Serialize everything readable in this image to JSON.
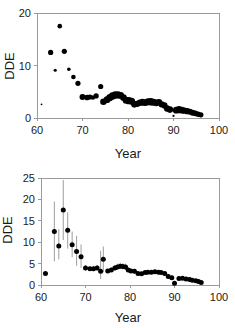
{
  "figure": {
    "background": "#ffffff",
    "point_color": "#000000",
    "axis_color": "#9a9a9a",
    "errorbar_color": "#9d9d9d"
  },
  "chart_data": [
    {
      "type": "scatter",
      "id": "top-panel",
      "title": "",
      "xlabel": "Year",
      "ylabel": "DDE",
      "xlim": [
        60,
        100
      ],
      "ylim": [
        0,
        20
      ],
      "xticks": [
        60,
        70,
        80,
        90,
        100
      ],
      "yticks": [
        0,
        10,
        20
      ],
      "xtick_labels": [
        "60",
        "70",
        "80",
        "90",
        "100"
      ],
      "ytick_labels": [
        "0",
        "10",
        "20"
      ],
      "grid": false,
      "legend": "none",
      "note": "Bubble scatter; marker area scales with sample size",
      "x": [
        61,
        63,
        64,
        65,
        66,
        67,
        68,
        69,
        70,
        71,
        71.6,
        72.3,
        73,
        74,
        74.6,
        75.4,
        76,
        76.6,
        77.2,
        77.8,
        78.4,
        79,
        79.6,
        80.2,
        80.8,
        81.4,
        82,
        82.6,
        83.2,
        83.8,
        84.4,
        85,
        85.6,
        86.2,
        86.8,
        87.4,
        88,
        88.6,
        89.2,
        90,
        90.6,
        91.2,
        91.8,
        92.4,
        93,
        93.6,
        94.2,
        94.8,
        95.4,
        96
      ],
      "y": [
        2.6,
        12.5,
        9.1,
        17.5,
        12.7,
        9.3,
        7.8,
        6.6,
        4.0,
        3.9,
        4.0,
        3.9,
        4.2,
        6.0,
        3.1,
        3.5,
        3.9,
        4.2,
        4.4,
        4.4,
        4.3,
        3.9,
        3.4,
        3.3,
        3.2,
        2.6,
        2.7,
        2.9,
        3.0,
        2.9,
        3.1,
        3.1,
        3.0,
        2.9,
        3.0,
        2.6,
        2.4,
        1.8,
        1.6,
        0.4,
        1.5,
        1.6,
        1.5,
        1.4,
        1.3,
        1.2,
        1.0,
        0.9,
        0.7,
        0.6
      ],
      "size": [
        0.9,
        2.6,
        1.6,
        2.3,
        2.6,
        1.8,
        2.3,
        2.6,
        3.0,
        2.8,
        2.6,
        2.2,
        2.6,
        2.6,
        3.3,
        3.4,
        3.6,
        3.8,
        3.7,
        3.6,
        3.4,
        3.4,
        3.5,
        3.6,
        3.5,
        3.3,
        3.2,
        3.3,
        3.4,
        3.3,
        3.6,
        3.7,
        3.6,
        3.4,
        3.3,
        3.2,
        3.1,
        3.2,
        3.3,
        1.1,
        3.4,
        3.6,
        3.4,
        3.2,
        3.1,
        3.0,
        2.9,
        2.9,
        2.8,
        2.7
      ]
    },
    {
      "type": "scatter",
      "id": "bottom-panel",
      "title": "",
      "xlabel": "Year",
      "ylabel": "DDE",
      "xlim": [
        60,
        100
      ],
      "ylim": [
        0,
        25
      ],
      "xticks": [
        60,
        70,
        80,
        90,
        100
      ],
      "yticks": [
        0,
        5,
        10,
        15,
        20,
        25
      ],
      "xtick_labels": [
        "60",
        "70",
        "80",
        "90",
        "100"
      ],
      "ytick_labels": [
        "0",
        "5",
        "10",
        "15",
        "20",
        "25"
      ],
      "grid": false,
      "legend": "none",
      "note": "Scatter with vertical error bars (confidence intervals)",
      "x": [
        61,
        63,
        64,
        65,
        66,
        67,
        68,
        69,
        70,
        71,
        71.8,
        72.6,
        73.4,
        74,
        75,
        75.8,
        76.6,
        77.2,
        77.8,
        78.4,
        79,
        79.6,
        80.2,
        81,
        81.8,
        82.6,
        83.4,
        84,
        84.8,
        85.6,
        86.4,
        87,
        87.8,
        88.6,
        89.4,
        90,
        91,
        91.8,
        92.6,
        93.4,
        94,
        94.8,
        95.4,
        96
      ],
      "y": [
        2.7,
        12.5,
        9.1,
        17.5,
        12.8,
        9.4,
        7.8,
        6.6,
        4.0,
        3.8,
        3.8,
        4.0,
        3.2,
        6.0,
        3.3,
        3.5,
        4.0,
        4.2,
        4.4,
        4.3,
        4.2,
        3.5,
        3.3,
        3.2,
        2.7,
        2.6,
        2.9,
        3.0,
        3.0,
        3.1,
        3.0,
        2.9,
        2.7,
        2.0,
        1.7,
        0.4,
        1.5,
        1.6,
        1.4,
        1.3,
        1.1,
        1.0,
        0.8,
        0.6
      ],
      "yerr_low": [
        0.0,
        5.5,
        6.0,
        10.5,
        8.5,
        6.5,
        4.5,
        4.0,
        3.3,
        3.3,
        3.2,
        3.4,
        1.4,
        3.0,
        2.8,
        3.0,
        3.4,
        3.6,
        3.7,
        3.6,
        3.5,
        3.0,
        2.9,
        2.7,
        2.3,
        2.2,
        2.5,
        2.6,
        2.6,
        2.7,
        2.6,
        2.5,
        2.3,
        1.6,
        1.3,
        0.0,
        1.2,
        1.3,
        1.1,
        1.0,
        0.8,
        0.7,
        0.6,
        0.4
      ],
      "yerr_high": [
        0.0,
        19.5,
        13.0,
        24.5,
        17.0,
        12.5,
        11.5,
        9.5,
        4.7,
        4.4,
        4.5,
        4.7,
        8.0,
        9.0,
        3.8,
        4.1,
        4.7,
        5.0,
        5.2,
        5.1,
        5.0,
        4.1,
        3.8,
        3.8,
        3.2,
        3.1,
        3.4,
        3.5,
        3.5,
        3.6,
        3.5,
        3.4,
        3.2,
        2.5,
        2.2,
        0.0,
        1.9,
        2.0,
        1.8,
        1.7,
        1.5,
        1.4,
        1.1,
        0.9
      ]
    }
  ]
}
